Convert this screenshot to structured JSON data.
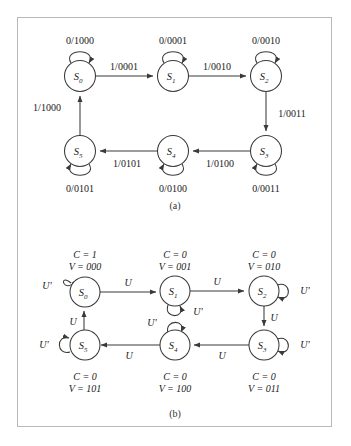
{
  "figure": {
    "panels": [
      {
        "id": "a",
        "caption": "(a)",
        "type": "mealy-state-diagram",
        "states": [
          {
            "name": "S",
            "sub": "0",
            "cx": 80,
            "cy": 76
          },
          {
            "name": "S",
            "sub": "1",
            "cx": 173,
            "cy": 76
          },
          {
            "name": "S",
            "sub": "2",
            "cx": 266,
            "cy": 76
          },
          {
            "name": "S",
            "sub": "3",
            "cx": 266,
            "cy": 151
          },
          {
            "name": "S",
            "sub": "4",
            "cx": 173,
            "cy": 151
          },
          {
            "name": "S",
            "sub": "5",
            "cx": 80,
            "cy": 151
          }
        ],
        "self_loops": [
          {
            "state": "S0",
            "label": "0/1000",
            "side": "top"
          },
          {
            "state": "S1",
            "label": "0/0001",
            "side": "top"
          },
          {
            "state": "S2",
            "label": "0/0010",
            "side": "top"
          },
          {
            "state": "S3",
            "label": "0/0011",
            "side": "bottom"
          },
          {
            "state": "S4",
            "label": "0/0100",
            "side": "bottom"
          },
          {
            "state": "S5",
            "label": "0/0101",
            "side": "bottom"
          }
        ],
        "transitions": [
          {
            "from": "S0",
            "to": "S1",
            "label": "1/0001"
          },
          {
            "from": "S1",
            "to": "S2",
            "label": "1/0010"
          },
          {
            "from": "S2",
            "to": "S3",
            "label": "1/0011"
          },
          {
            "from": "S3",
            "to": "S4",
            "label": "1/0100"
          },
          {
            "from": "S4",
            "to": "S5",
            "label": "1/0101"
          },
          {
            "from": "S5",
            "to": "S0",
            "label": "1/1000"
          }
        ]
      },
      {
        "id": "b",
        "caption": "(b)",
        "type": "moore-state-diagram",
        "states": [
          {
            "name": "S",
            "sub": "0",
            "cx": 85,
            "cy": 292,
            "C": "C = 1",
            "V": "V = 000"
          },
          {
            "name": "S",
            "sub": "1",
            "cx": 175,
            "cy": 291,
            "C": "C = 0",
            "V": "V = 001"
          },
          {
            "name": "S",
            "sub": "2",
            "cx": 264,
            "cy": 291,
            "C": "C = 0",
            "V": "V = 010"
          },
          {
            "name": "S",
            "sub": "3",
            "cx": 264,
            "cy": 345,
            "C": "C = 0",
            "V": "V = 011"
          },
          {
            "name": "S",
            "sub": "4",
            "cx": 175,
            "cy": 345,
            "C": "C = 0",
            "V": "V = 100"
          },
          {
            "name": "S",
            "sub": "5",
            "cx": 82,
            "cy": 345,
            "C": "C = 0",
            "V": "V = 101"
          }
        ],
        "self_loops": [
          {
            "state": "S0",
            "label": "U'",
            "side": "top-left"
          },
          {
            "state": "S1",
            "label": "U'",
            "side": "bottom-right"
          },
          {
            "state": "S2",
            "label": "U'",
            "side": "right"
          },
          {
            "state": "S3",
            "label": "U'",
            "side": "right"
          },
          {
            "state": "S4",
            "label": "U'",
            "side": "top"
          },
          {
            "state": "S5",
            "label": "U'",
            "side": "left"
          }
        ],
        "transitions": [
          {
            "from": "S0",
            "to": "S1",
            "label": "U"
          },
          {
            "from": "S1",
            "to": "S2",
            "label": "U"
          },
          {
            "from": "S2",
            "to": "S3",
            "label": "U"
          },
          {
            "from": "S3",
            "to": "S4",
            "label": "U"
          },
          {
            "from": "S4",
            "to": "S5",
            "label": "U"
          },
          {
            "from": "S5",
            "to": "S0",
            "label": "U"
          }
        ]
      }
    ],
    "colors": {
      "stroke": "#3a3a3a",
      "text": "#1a1a1a",
      "border": "#b9b9b9",
      "background": "#ffffff"
    }
  },
  "labels": {
    "a": {
      "loop_s0": "0/1000",
      "loop_s1": "0/0001",
      "loop_s2": "0/0010",
      "loop_s3": "0/0011",
      "loop_s4": "0/0100",
      "loop_s5": "0/0101",
      "t_s0_s1": "1/0001",
      "t_s1_s2": "1/0010",
      "t_s2_s3": "1/0011",
      "t_s3_s4": "1/0100",
      "t_s4_s5": "1/0101",
      "t_s5_s0": "1/1000",
      "caption": "(a)"
    },
    "b": {
      "loop_s0": "U'",
      "loop_s1": "U'",
      "loop_s2": "U'",
      "loop_s3": "U'",
      "loop_s4": "U'",
      "loop_s5": "U'",
      "t_s0_s1": "U",
      "t_s1_s2": "U",
      "t_s2_s3": "U",
      "t_s3_s4": "U",
      "t_s4_s5": "U",
      "t_s5_s0": "U",
      "out_s0_c": "C = 1",
      "out_s0_v": "V = 000",
      "out_s1_c": "C = 0",
      "out_s1_v": "V = 001",
      "out_s2_c": "C = 0",
      "out_s2_v": "V = 010",
      "out_s3_c": "C = 0",
      "out_s3_v": "V = 011",
      "out_s4_c": "C = 0",
      "out_s4_v": "V = 100",
      "out_s5_c": "C = 0",
      "out_s5_v": "V = 101",
      "caption": "(b)"
    },
    "states": {
      "s0": "S",
      "s0_sub": "0",
      "s1": "S",
      "s1_sub": "1",
      "s2": "S",
      "s2_sub": "2",
      "s3": "S",
      "s3_sub": "3",
      "s4": "S",
      "s4_sub": "4",
      "s5": "S",
      "s5_sub": "5"
    }
  }
}
